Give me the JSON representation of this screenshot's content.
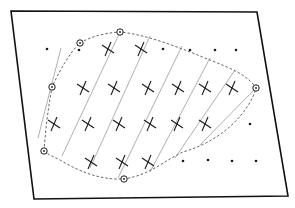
{
  "figure": {
    "width": 295,
    "height": 208,
    "background": "#ffffff",
    "ink": "#1a1a1a",
    "hatch_color": "#9a9a9a",
    "frame": {
      "points": [
        [
          11,
          11
        ],
        [
          257,
          12
        ],
        [
          288,
          196
        ],
        [
          34,
          199
        ]
      ],
      "stroke": "#111111"
    },
    "boundary": {
      "style": "dashed",
      "path": "M 44 151 C 46 125, 48 110, 52 87 C 60 70, 70 52, 80 43 C 92 36, 105 33, 120 32 C 150 35, 185 50, 210 60 C 230 68, 248 75, 256 88 C 250 110, 225 140, 183 152 C 165 160, 150 175, 124 179 C 100 180, 80 172, 60 160 C 52 156, 47 154, 44 151 Z"
    },
    "circled_points": [
      [
        120,
        32
      ],
      [
        80,
        43
      ],
      [
        52,
        87
      ],
      [
        44,
        151
      ],
      [
        124,
        179
      ],
      [
        256,
        88
      ]
    ],
    "crosses": [
      [
        108,
        49
      ],
      [
        141,
        49
      ],
      [
        83,
        88
      ],
      [
        114,
        88
      ],
      [
        148,
        88
      ],
      [
        178,
        88
      ],
      [
        205,
        88
      ],
      [
        232,
        88
      ],
      [
        54,
        124
      ],
      [
        88,
        124
      ],
      [
        119,
        124
      ],
      [
        150,
        124
      ],
      [
        177,
        124
      ],
      [
        205,
        124
      ],
      [
        91,
        162
      ],
      [
        122,
        162
      ],
      [
        148,
        162
      ]
    ],
    "dots": [
      [
        47,
        49
      ],
      [
        79,
        50
      ],
      [
        163,
        49
      ],
      [
        190,
        50
      ],
      [
        215,
        50
      ],
      [
        236,
        50
      ],
      [
        250,
        124
      ],
      [
        183,
        161
      ],
      [
        208,
        160
      ],
      [
        232,
        161
      ],
      [
        256,
        161
      ]
    ],
    "hatch_lines": [
      [
        [
          61,
          48
        ],
        [
          38,
          138
        ]
      ],
      [
        [
          120,
          32
        ],
        [
          62,
          156
        ]
      ],
      [
        [
          150,
          36
        ],
        [
          90,
          168
        ]
      ],
      [
        [
          182,
          46
        ],
        [
          118,
          178
        ]
      ],
      [
        [
          210,
          58
        ],
        [
          150,
          172
        ]
      ],
      [
        [
          235,
          70
        ],
        [
          175,
          158
        ]
      ],
      [
        [
          256,
          88
        ],
        [
          200,
          145
        ]
      ]
    ]
  }
}
